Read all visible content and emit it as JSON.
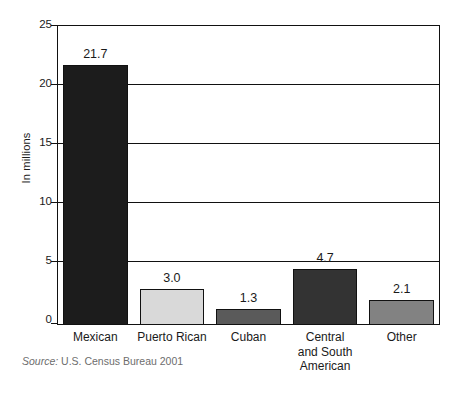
{
  "chart_data": {
    "type": "bar",
    "title": "",
    "subtitle": "",
    "xlabel": "",
    "ylabel": "In millions",
    "ylim": [
      0,
      25
    ],
    "ytick_step": 5,
    "yticks": [
      "25",
      "20",
      "15",
      "10",
      "5",
      "0"
    ],
    "grid": true,
    "legend": "none",
    "categories": [
      "Mexican",
      "Puerto Rican",
      "Cuban",
      "Central and South American",
      "Other"
    ],
    "category_lines": [
      [
        "Mexican"
      ],
      [
        "Puerto Rican"
      ],
      [
        "Cuban"
      ],
      [
        "Central",
        "and South",
        "American"
      ],
      [
        "Other"
      ]
    ],
    "values": [
      21.7,
      3.0,
      1.3,
      4.7,
      2.1
    ],
    "value_labels": [
      "21.7",
      "3.0",
      "1.3",
      "4.7",
      "2.1"
    ],
    "bar_colors": [
      "#1c1c1c",
      "#d9d9d9",
      "#5a5a5a",
      "#333333",
      "#828282"
    ],
    "bar_edge_color": "#111111",
    "axis_color": "#111111",
    "text_color": "#1a1a1a",
    "background": "#ffffff",
    "annotations": []
  },
  "source": {
    "prefix": "Source:",
    "text": "U.S. Census Bureau 2001",
    "color": "#6d6d6d"
  }
}
